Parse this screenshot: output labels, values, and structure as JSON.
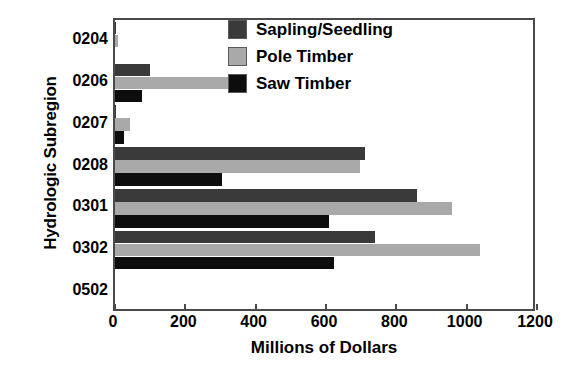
{
  "chart_data": {
    "type": "bar",
    "orientation": "horizontal",
    "title": "",
    "xlabel": "Millions of Dollars",
    "ylabel": "Hydrologic Subregion",
    "xlim": [
      0,
      1200
    ],
    "xticks": [
      0,
      200,
      400,
      600,
      800,
      1000,
      1200
    ],
    "xtick_labels": [
      "0",
      "200",
      "400",
      "600",
      "800",
      "1000",
      "1200"
    ],
    "categories": [
      "0204",
      "0206",
      "0207",
      "0208",
      "0301",
      "0302",
      "0502"
    ],
    "grid": false,
    "legend_position": "upper right",
    "series": [
      {
        "name": "Sapling/Seedling",
        "color": "#3a3a3a",
        "values": [
          3,
          100,
          4,
          710,
          858,
          738,
          0
        ]
      },
      {
        "name": "Pole Timber",
        "color": "#a9a9a9",
        "values": [
          8,
          370,
          43,
          697,
          957,
          1037,
          0
        ]
      },
      {
        "name": "Saw Timber",
        "color": "#0d0d0d",
        "values": [
          0,
          78,
          26,
          304,
          608,
          622,
          0
        ]
      }
    ]
  }
}
